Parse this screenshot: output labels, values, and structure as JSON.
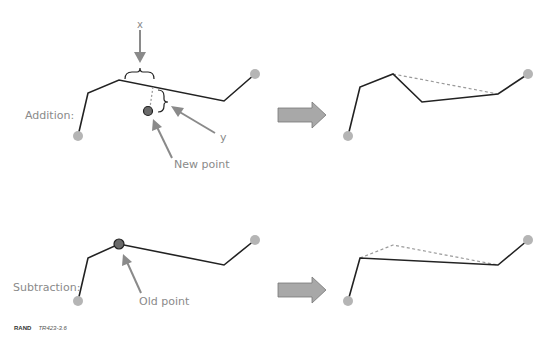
{
  "figure": {
    "rows": [
      {
        "name": "addition",
        "label": "Addition:",
        "annotations": {
          "x_label": "x",
          "y_label": "y",
          "point_label": "New point"
        }
      },
      {
        "name": "subtraction",
        "label": "Subtraction:",
        "annotations": {
          "point_label": "Old point"
        }
      }
    ],
    "footer": {
      "org": "RAND",
      "id": "TR423-3.6"
    },
    "colors": {
      "line": "#222222",
      "endpoint": "#b5b5b5",
      "highlight_point": "#6a6a6a",
      "dashed": "#9a9a9a",
      "arrow_fill": "#a8a8a8",
      "label": "#8a8a8a"
    }
  }
}
